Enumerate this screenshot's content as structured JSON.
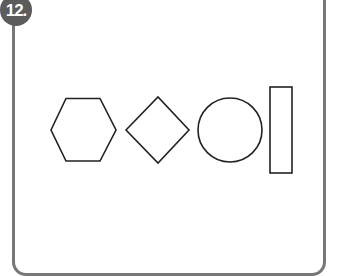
{
  "problem": {
    "number_label": "12.",
    "badge_color": "#5c5c5c",
    "frame_color": "#777777"
  },
  "shapes": [
    {
      "name": "hexagon"
    },
    {
      "name": "diamond"
    },
    {
      "name": "circle"
    },
    {
      "name": "rectangle"
    }
  ]
}
